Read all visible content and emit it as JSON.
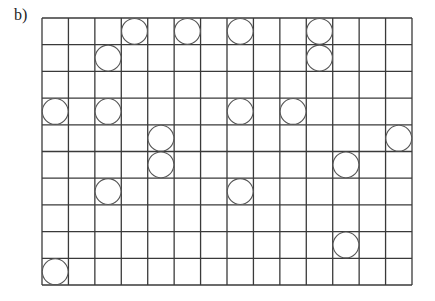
{
  "label": "b)",
  "grid": {
    "cols": 14,
    "rows": 10,
    "left": 42,
    "top": 18,
    "width": 370,
    "height": 267,
    "line_color": "#3a3a3a",
    "circle_color": "#555555"
  },
  "circles": [
    {
      "col": 3,
      "row": 0
    },
    {
      "col": 5,
      "row": 0
    },
    {
      "col": 7,
      "row": 0
    },
    {
      "col": 10,
      "row": 0
    },
    {
      "col": 2,
      "row": 1
    },
    {
      "col": 10,
      "row": 1
    },
    {
      "col": 0,
      "row": 3
    },
    {
      "col": 2,
      "row": 3
    },
    {
      "col": 7,
      "row": 3
    },
    {
      "col": 9,
      "row": 3
    },
    {
      "col": 4,
      "row": 4
    },
    {
      "col": 13,
      "row": 4
    },
    {
      "col": 4,
      "row": 5
    },
    {
      "col": 11,
      "row": 5
    },
    {
      "col": 2,
      "row": 6
    },
    {
      "col": 7,
      "row": 6
    },
    {
      "col": 11,
      "row": 8
    },
    {
      "col": 0,
      "row": 9
    }
  ]
}
